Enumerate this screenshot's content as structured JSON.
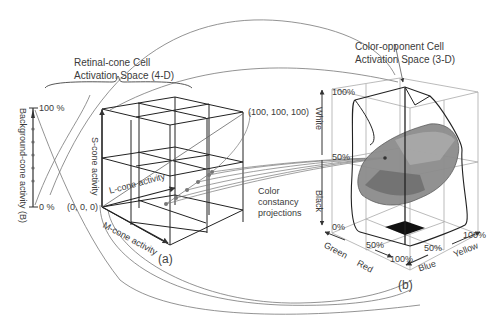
{
  "panel_a": {
    "title_line1": "Retinal-cone Cell",
    "title_line2": "Activation Space (4-D)",
    "label": "(a)",
    "background_axis": {
      "label": "Background-cone activity (B)",
      "max": "100 %",
      "min": "0 %"
    },
    "s_axis": "S-cone activity",
    "l_axis": "L-cone activity",
    "m_axis": "M-cone activity",
    "origin": "(0, 0, 0)",
    "corner": "(100, 100, 100)"
  },
  "projections_label_line1": "Color",
  "projections_label_line2": "constancy",
  "projections_label_line3": "projections",
  "panel_b": {
    "title_line1": "Color-opponent Cell",
    "title_line2": "Activation Space (3-D)",
    "label": "(b)",
    "white_axis": "White",
    "black_axis": "Black",
    "v100": "100%",
    "v50": "50%",
    "v0": "0%",
    "green": "Green",
    "red": "Red",
    "blue": "Blue",
    "yellow": "Yellow",
    "gr50": "50%",
    "gr100": "100%",
    "by50": "50%",
    "by100": "100%"
  }
}
